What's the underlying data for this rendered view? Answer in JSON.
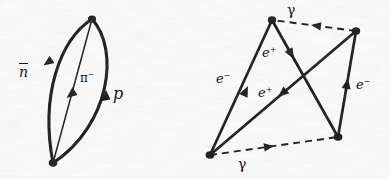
{
  "figure": {
    "background_color": "#fbfbfa",
    "ink_color": "#141414",
    "width": 390,
    "height": 179
  },
  "diagram_left": {
    "name": "pion-proton-antineutron-loop",
    "vertices": [
      {
        "id": "top",
        "x": 92,
        "y": 19
      },
      {
        "id": "bottom",
        "x": 53,
        "y": 163
      }
    ],
    "labels": {
      "antineutron": "n",
      "antineutron_bar": true,
      "pion": "π",
      "pion_charge": "−",
      "proton": "p"
    }
  },
  "diagram_right": {
    "name": "electron-positron-photon-box",
    "vertices": [
      {
        "id": "top-left",
        "x": 272,
        "y": 20
      },
      {
        "id": "top-right",
        "x": 356,
        "y": 31
      },
      {
        "id": "bottom-left",
        "x": 210,
        "y": 155
      },
      {
        "id": "bottom-right",
        "x": 338,
        "y": 137
      }
    ],
    "labels": {
      "photon_top": "γ",
      "photon_bottom": "γ",
      "electron_left": "e",
      "electron_left_charge": "−",
      "electron_right": "e",
      "electron_right_charge": "−",
      "positron_upper": "e",
      "positron_upper_charge": "+",
      "positron_lower": "e",
      "positron_lower_charge": "+"
    }
  }
}
